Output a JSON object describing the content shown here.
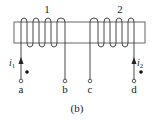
{
  "diagram": {
    "caption": "(b)",
    "coils": [
      {
        "label": "1",
        "turns": 4
      },
      {
        "label": "2",
        "turns": 4
      }
    ],
    "terminals": [
      {
        "label": "a"
      },
      {
        "label": "b"
      },
      {
        "label": "c"
      },
      {
        "label": "d"
      }
    ],
    "currents": [
      {
        "symbol": "i",
        "subscript": "1",
        "terminal": "a",
        "direction": "up"
      },
      {
        "symbol": "i",
        "subscript": "2",
        "terminal": "d",
        "direction": "up"
      }
    ],
    "polarity_dots": [
      "a",
      "d"
    ],
    "colors": {
      "line": "#333333",
      "background": "#ffffff"
    }
  }
}
